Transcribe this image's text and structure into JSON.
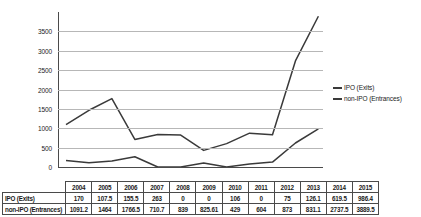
{
  "chart_data": {
    "type": "line",
    "title": "",
    "xlabel": "",
    "ylabel": "",
    "ylim": [
      0,
      4000
    ],
    "yticks": [
      0,
      500,
      1000,
      1500,
      2000,
      2500,
      3000,
      3500
    ],
    "ytick_labels": [
      "0",
      "500",
      "1000",
      "1500",
      "2000",
      "2500",
      "3000",
      "3500"
    ],
    "grid": true,
    "legend_position": "right",
    "categories": [
      "2004",
      "2005",
      "2006",
      "2007",
      "2008",
      "2009",
      "2010",
      "2011",
      "2012",
      "2013",
      "2014",
      "2015"
    ],
    "series": [
      {
        "name": "IPO (Exits)",
        "color": "#3a3a3a",
        "values": [
          170,
          107.5,
          155.5,
          263,
          0,
          0,
          106,
          0,
          75,
          126.1,
          619.5,
          986.4
        ],
        "labels": [
          "170",
          "107.5",
          "155.5",
          "263",
          "0",
          "0",
          "106",
          "0",
          "75",
          "126.1",
          "619.5",
          "986.4"
        ]
      },
      {
        "name": "non-IPO (Entrances)",
        "color": "#3a3a3a",
        "values": [
          1091.2,
          1464,
          1766.5,
          710.7,
          839,
          825.61,
          429,
          604,
          873,
          831.1,
          2737.5,
          3889.5
        ],
        "labels": [
          "1091.2",
          "1464",
          "1766.5",
          "710.7",
          "839",
          "825.61",
          "429",
          "604",
          "873",
          "831.1",
          "2737.5",
          "3889.5"
        ]
      }
    ]
  },
  "legend": {
    "items": [
      {
        "label": "IPO (Exits)"
      },
      {
        "label": "non-IPO (Entrances)"
      }
    ]
  },
  "data_table": {
    "corner_label": "",
    "column_headers": [
      "2004",
      "2005",
      "2006",
      "2007",
      "2008",
      "2009",
      "2010",
      "2011",
      "2012",
      "2013",
      "2014",
      "2015"
    ],
    "rows": [
      {
        "label": "IPO (Exits)",
        "values": [
          "170",
          "107.5",
          "155.5",
          "263",
          "0",
          "0",
          "106",
          "0",
          "75",
          "126.1",
          "619.5",
          "986.4"
        ]
      },
      {
        "label": "non-IPO (Entrances)",
        "values": [
          "1091.2",
          "1464",
          "1766.5",
          "710.7",
          "839",
          "825.61",
          "429",
          "604",
          "873",
          "831.1",
          "2737.5",
          "3889.5"
        ]
      }
    ]
  }
}
